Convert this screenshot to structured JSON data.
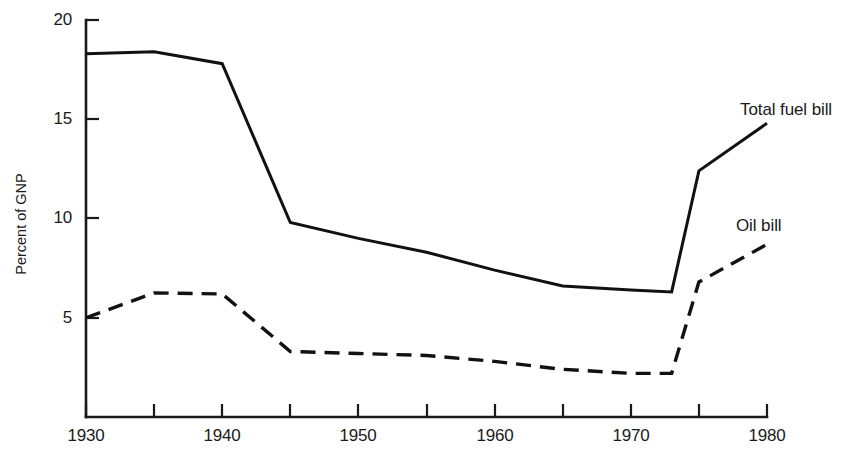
{
  "chart_data": {
    "type": "line",
    "title": "",
    "subtitle": "",
    "xlabel": "",
    "ylabel": "Percent of GNP",
    "xlim": [
      1930,
      1980
    ],
    "ylim": [
      0,
      20
    ],
    "grid": false,
    "legend_position": "inline-annotations",
    "x_ticks": [
      {
        "value": 1930,
        "label": "1930",
        "labeled": true
      },
      {
        "value": 1935,
        "label": "",
        "labeled": false
      },
      {
        "value": 1940,
        "label": "1940",
        "labeled": true
      },
      {
        "value": 1945,
        "label": "",
        "labeled": false
      },
      {
        "value": 1950,
        "label": "1950",
        "labeled": true
      },
      {
        "value": 1955,
        "label": "",
        "labeled": false
      },
      {
        "value": 1960,
        "label": "1960",
        "labeled": true
      },
      {
        "value": 1965,
        "label": "",
        "labeled": false
      },
      {
        "value": 1970,
        "label": "1970",
        "labeled": true
      },
      {
        "value": 1975,
        "label": "",
        "labeled": false
      },
      {
        "value": 1980,
        "label": "1980",
        "labeled": true
      }
    ],
    "y_ticks": [
      {
        "value": 5,
        "label": "5"
      },
      {
        "value": 10,
        "label": "10"
      },
      {
        "value": 15,
        "label": "15"
      },
      {
        "value": 20,
        "label": "20"
      }
    ],
    "series": [
      {
        "name": "Total fuel bill",
        "style": "solid",
        "annotation_label": "Total fuel bill",
        "x": [
          1930,
          1935,
          1940,
          1945,
          1950,
          1955,
          1960,
          1965,
          1970,
          1973,
          1975,
          1980
        ],
        "values": [
          18.3,
          18.4,
          17.8,
          9.8,
          9.0,
          8.3,
          7.4,
          6.6,
          6.4,
          6.3,
          12.4,
          14.8
        ]
      },
      {
        "name": "Oil bill",
        "style": "dashed",
        "annotation_label": "Oil bill",
        "x": [
          1930,
          1935,
          1940,
          1945,
          1950,
          1955,
          1960,
          1965,
          1970,
          1973,
          1975,
          1980
        ],
        "values": [
          5.0,
          6.25,
          6.2,
          3.3,
          3.2,
          3.1,
          2.8,
          2.4,
          2.2,
          2.2,
          6.8,
          8.7
        ]
      }
    ]
  },
  "annotations": {
    "total_fuel_bill": "Total fuel bill",
    "oil_bill": "Oil bill"
  },
  "axis": {
    "y_title": "Percent of GNP",
    "y_tick_20": "20",
    "y_tick_15": "15",
    "y_tick_10": "10",
    "y_tick_5": "5",
    "x_tick_1930": "1930",
    "x_tick_1940": "1940",
    "x_tick_1950": "1950",
    "x_tick_1960": "1960",
    "x_tick_1970": "1970",
    "x_tick_1980": "1980"
  },
  "colors": {
    "ink": "#1a1a1a",
    "background": "#ffffff"
  }
}
